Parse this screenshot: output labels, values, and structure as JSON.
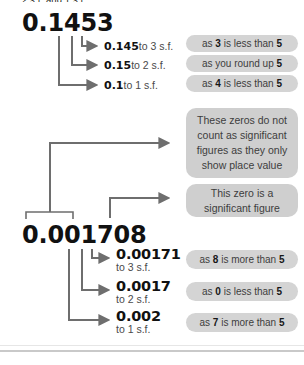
{
  "diagram": {
    "top_caption": "2 s.f. and 1 s.f.",
    "examples": [
      {
        "number": "0.1453",
        "branches": [
          {
            "value": "0.145",
            "precision": "to 3 s.f.",
            "reason_pre": "as ",
            "reason_bold1": "3",
            "reason_mid": " is less than ",
            "reason_bold2": "5",
            "reason_post": ""
          },
          {
            "value": "0.15",
            "precision": "to 2 s.f.",
            "reason_pre": "as you round up ",
            "reason_bold1": "5",
            "reason_mid": "",
            "reason_bold2": "",
            "reason_post": ""
          },
          {
            "value": "0.1",
            "precision": "to 1 s.f.",
            "reason_pre": "as ",
            "reason_bold1": "4",
            "reason_mid": " is less than ",
            "reason_bold2": "5",
            "reason_post": ""
          }
        ]
      },
      {
        "number": "0.001708",
        "annotations": [
          {
            "text": "These zeros do not count as significant figures as they only show place value"
          },
          {
            "text": "This zero is a significant figure"
          }
        ],
        "branches": [
          {
            "value": "0.00171",
            "precision": "to 3 s.f.",
            "reason_pre": "as ",
            "reason_bold1": "8",
            "reason_mid": " is more than ",
            "reason_bold2": "5",
            "reason_post": ""
          },
          {
            "value": "0.0017",
            "precision": "to 2 s.f.",
            "reason_pre": "as ",
            "reason_bold1": "0",
            "reason_mid": " is less than ",
            "reason_bold2": "5",
            "reason_post": ""
          },
          {
            "value": "0.002",
            "precision": "to 1 s.f.",
            "reason_pre": "as ",
            "reason_bold1": "7",
            "reason_mid": " is more than ",
            "reason_bold2": "5",
            "reason_post": ""
          }
        ]
      }
    ]
  },
  "colors": {
    "callout_bg": "#d4d4d4",
    "callout_bg_alt": "#cfcfcf",
    "line": "#6e6e6e",
    "number": "#111111",
    "border": "#c9c9c9"
  }
}
